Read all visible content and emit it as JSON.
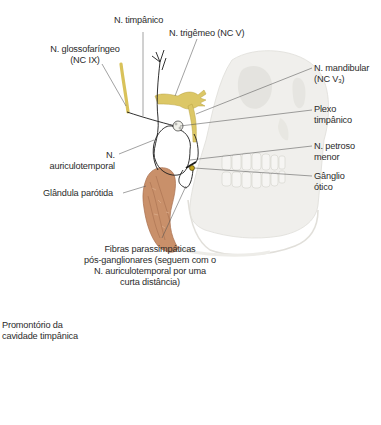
{
  "figure": {
    "colors": {
      "nerve_yellow": "#d9c25a",
      "nerve_black": "#1a1a1a",
      "parotid": "#c9906a",
      "skull": "#e9e8e3",
      "leader_line": "#555555"
    }
  },
  "labels": {
    "n_timpanico": {
      "lines": [
        "N. timpânico"
      ]
    },
    "n_trigemeo": {
      "lines": [
        "N. trigêmeo (NC V)"
      ]
    },
    "n_glossofaringeo": {
      "lines": [
        "N. glossofaríngeo",
        "(NC IX)"
      ]
    },
    "n_mandibular": {
      "line1": "N. mandibular",
      "line2_prefix": "(NC V",
      "line2_sub": "3",
      "line2_suffix": ")"
    },
    "plexo_timpanico": {
      "lines": [
        "Plexo",
        "timpânico"
      ]
    },
    "n_auriculotemporal": {
      "lines": [
        "N.",
        "auriculotemporal"
      ]
    },
    "n_petroso_menor": {
      "lines": [
        "N. petroso",
        "menor"
      ]
    },
    "glandula_parotida": {
      "lines": [
        "Glândula parótida"
      ]
    },
    "ganglio_otico": {
      "lines": [
        "Gânglio",
        "ótico"
      ]
    },
    "fibras": {
      "lines": [
        "Fibras parassimpáticas",
        "pós-ganglionares (seguem com o",
        "N. auriculotemporal por uma",
        "curta distância)"
      ]
    },
    "promontorio": {
      "lines": [
        "Promontório da",
        "cavidade timpânica"
      ]
    }
  }
}
